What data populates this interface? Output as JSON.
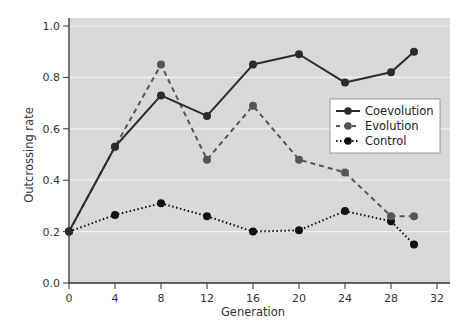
{
  "chart_data": {
    "type": "line",
    "title": "",
    "xlabel": "Generation",
    "ylabel": "Outcrossing rate",
    "xlim": [
      0,
      32
    ],
    "ylim": [
      0.0,
      1.0
    ],
    "xticks": [
      0,
      4,
      8,
      12,
      16,
      20,
      24,
      28,
      32
    ],
    "yticks": [
      0.0,
      0.2,
      0.4,
      0.6,
      0.8,
      1.0
    ],
    "xtick_labels": [
      "0",
      "4",
      "8",
      "12",
      "16",
      "20",
      "24",
      "28",
      "32"
    ],
    "ytick_labels": [
      "0.0",
      "0.2",
      "0.4",
      "0.6",
      "0.8",
      "1.0"
    ],
    "grid": "horizontal",
    "legend_position": "right-center",
    "series": [
      {
        "name": "Coevolution",
        "style": "solid",
        "color": "#2b2b2b",
        "x": [
          0,
          4,
          8,
          12,
          16,
          20,
          24,
          28,
          30
        ],
        "values": [
          0.2,
          0.53,
          0.73,
          0.65,
          0.85,
          0.89,
          0.78,
          0.82,
          0.9
        ]
      },
      {
        "name": "Evolution",
        "style": "dashed",
        "color": "#555555",
        "x": [
          0,
          4,
          8,
          12,
          16,
          20,
          24,
          28,
          30
        ],
        "values": [
          0.2,
          0.53,
          0.85,
          0.48,
          0.69,
          0.48,
          0.43,
          0.26,
          0.26
        ]
      },
      {
        "name": "Control",
        "style": "dotted",
        "color": "#111111",
        "x": [
          0,
          4,
          8,
          12,
          16,
          20,
          24,
          28,
          30
        ],
        "values": [
          0.2,
          0.265,
          0.31,
          0.26,
          0.2,
          0.205,
          0.28,
          0.24,
          0.15
        ]
      }
    ]
  },
  "colors": {
    "plot_background": "#d9d9d9",
    "grid": "#f2f2f2",
    "axis": "#333333"
  }
}
